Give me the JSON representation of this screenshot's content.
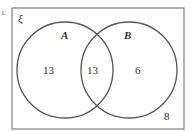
{
  "diagram": {
    "type": "venn",
    "question_marker": "1.",
    "universal_symbol": "ξ",
    "sets": [
      {
        "name": "A",
        "only": "13"
      },
      {
        "name": "B",
        "only": "6"
      }
    ],
    "intersection": "13",
    "outside": "8"
  }
}
